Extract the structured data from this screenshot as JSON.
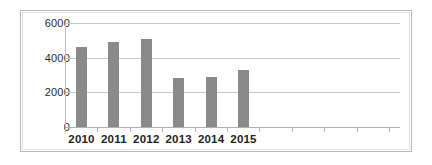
{
  "chart_data": {
    "type": "bar",
    "title": "",
    "subtitle": "",
    "xlabel": "",
    "ylabel": "",
    "categories": [
      "2010",
      "2011",
      "2012",
      "2013",
      "2014",
      "2015",
      "",
      "",
      "",
      ""
    ],
    "values": [
      4600,
      4900,
      5100,
      2800,
      2900,
      3300,
      null,
      null,
      null,
      null
    ],
    "series": [
      {
        "name": "",
        "values": [
          4600,
          4900,
          5100,
          2800,
          2900,
          3300,
          null,
          null,
          null,
          null
        ]
      }
    ],
    "ylim": [
      0,
      6000
    ],
    "yticks": [
      0,
      2000,
      4000,
      6000
    ],
    "ytick_labels": [
      "0",
      "2000",
      "4000",
      "6000"
    ],
    "xtick_labels": [
      "2010",
      "2011",
      "2012",
      "2013",
      "2014",
      "2015"
    ],
    "grid": true,
    "grid_axis": "y",
    "legend": false,
    "legend_position": "none",
    "annotations": [],
    "bar_color": "#8a8a8a",
    "gridline_color": "#c8c8c8",
    "axis_color": "#bdbdbd",
    "frame_color": "#b9b9b9",
    "background_color": "#ffffff",
    "text_color": "#1f1f1f",
    "empty_category_slots": 4
  }
}
